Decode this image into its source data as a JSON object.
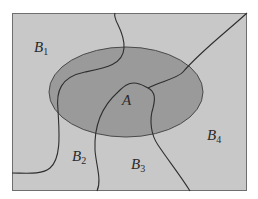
{
  "diagram": {
    "type": "venn-partition",
    "colors": {
      "background": "#ffffff",
      "sample_space_fill": "#c8c8c8",
      "sample_space_border": "#6e6e6e",
      "event_fill": "#9a9a9a",
      "event_border": "#4a4a4a",
      "partition_line": "#2e2e2e"
    },
    "labels": {
      "A": {
        "base": "A",
        "sub": ""
      },
      "B1": {
        "base": "B",
        "sub": "1"
      },
      "B2": {
        "base": "B",
        "sub": "2"
      },
      "B3": {
        "base": "B",
        "sub": "3"
      },
      "B4": {
        "base": "B",
        "sub": "4"
      }
    }
  }
}
